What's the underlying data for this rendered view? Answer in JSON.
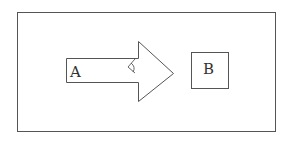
{
  "diagram": {
    "frame": {
      "x": 17,
      "y": 12,
      "width": 258,
      "height": 119,
      "stroke": "#555555"
    },
    "arrow": {
      "label": "A",
      "direction": "right",
      "stroke": "#555555",
      "fill": "#ffffff",
      "glyph": "angle-mark-icon"
    },
    "box": {
      "label": "B",
      "x": 191,
      "y": 52,
      "width": 37,
      "height": 36,
      "stroke": "#555555"
    }
  }
}
